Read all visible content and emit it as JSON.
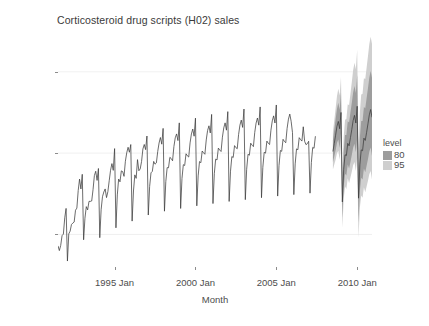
{
  "chart": {
    "title": "Corticosteroid drug scripts (H02) sales",
    "xlabel": "Month",
    "ylabel": "SAU (millions)"
  },
  "legend": {
    "title": "level",
    "items": [
      {
        "label": "80",
        "color": "#9d9d9d"
      },
      {
        "label": "95",
        "color": "#cfcfcf"
      }
    ]
  },
  "axes": {
    "y_ticks": [
      "0.5",
      "1.0",
      "1.5"
    ],
    "x_ticks": [
      "1995 Jan",
      "2000 Jan",
      "2005 Jan",
      "2010 Jan"
    ]
  },
  "chart_data": {
    "type": "line",
    "title": "Corticosteroid drug scripts (H02) sales",
    "xlabel": "Month",
    "ylabel": "SAU (millions)",
    "xlim": [
      "1991 Jul",
      "2010 Dec"
    ],
    "ylim": [
      0.3,
      1.72
    ],
    "y_ticks": [
      0.5,
      1.0,
      1.5
    ],
    "x_ticks": [
      "1995 Jan",
      "2000 Jan",
      "2005 Jan",
      "2010 Jan"
    ],
    "grid": "faint horizontal gridlines at y ticks",
    "legend": {
      "title": "level",
      "position": "right",
      "entries": [
        "80",
        "95"
      ]
    },
    "line_color": "#3b3b3b",
    "interval_colors": {
      "80": "#9d9d9d",
      "95": "#cfcfcf"
    },
    "series": [
      {
        "name": "H02 sales (observed)",
        "type": "line",
        "x_start": "1991 Jul",
        "frequency": "monthly",
        "values": [
          0.429795,
          0.400906,
          0.432159,
          0.492543,
          0.502369,
          0.602652,
          0.660119,
          0.336644,
          0.503512,
          0.52053,
          0.561429,
          0.570043,
          0.576349,
          0.649005,
          0.662149,
          0.770471,
          0.840345,
          0.77962,
          0.869781,
          0.467402,
          0.600015,
          0.671059,
          0.651093,
          0.70377,
          0.703104,
          0.705899,
          0.775434,
          0.86188,
          0.888622,
          0.832225,
          0.905444,
          0.48012,
          0.651685,
          0.73193,
          0.760985,
          0.779884,
          0.726736,
          0.763132,
          0.83,
          0.894543,
          0.9356,
          0.89402,
          1.02783,
          0.540793,
          0.743136,
          0.84052,
          0.823586,
          0.890857,
          0.886397,
          0.85716,
          0.94979,
          1.00188,
          1.03601,
          1.00543,
          1.0528,
          0.582128,
          0.767259,
          0.86628,
          0.844836,
          0.95994,
          0.891638,
          0.903057,
          0.94849,
          1.0254,
          1.05319,
          1.0215,
          1.1051,
          0.619459,
          0.795,
          0.8788,
          0.888,
          0.949,
          0.932,
          0.94,
          1.01,
          1.062,
          1.096,
          1.055,
          1.152,
          0.643,
          0.825,
          0.911,
          0.91,
          0.974,
          0.967,
          0.953,
          1.04,
          1.094,
          1.118,
          1.077,
          1.186,
          0.66,
          0.844,
          0.929,
          0.924,
          0.996,
          0.983,
          0.976,
          1.063,
          1.118,
          1.148,
          1.104,
          1.215,
          0.676,
          0.86,
          0.948,
          0.941,
          1.013,
          1.002,
          0.993,
          1.081,
          1.139,
          1.168,
          1.124,
          1.238,
          0.69,
          0.876,
          0.963,
          0.958,
          1.031,
          1.019,
          1.01,
          1.098,
          1.155,
          1.186,
          1.141,
          1.255,
          0.703,
          0.889,
          0.979,
          0.973,
          1.046,
          1.034,
          1.027,
          1.114,
          1.172,
          1.203,
          1.158,
          1.271,
          0.714,
          0.901,
          0.993,
          0.987,
          1.061,
          1.049,
          1.04,
          1.128,
          1.185,
          1.216,
          1.172,
          1.284,
          0.726,
          0.913,
          1.005,
          1.0,
          1.074,
          1.061,
          1.053,
          1.141,
          1.198,
          1.229,
          1.185,
          1.296,
          0.736,
          0.924,
          1.016,
          1.011,
          1.085,
          1.072,
          1.064,
          1.152,
          1.209,
          1.24,
          1.196,
          1.126,
          0.745,
          0.934,
          1.026,
          1.021,
          1.095,
          1.083,
          1.074,
          1.162,
          1.073,
          1.052,
          1.058,
          1.073,
          0.754,
          0.943,
          1.035,
          1.03,
          1.104
        ]
      },
      {
        "name": "Forecast (point)",
        "type": "line",
        "x_start": "2008 Jul",
        "frequency": "monthly",
        "values": [
          1.01,
          1.06,
          1.11,
          1.165,
          1.195,
          1.15,
          1.25,
          0.7,
          0.9,
          0.99,
          0.985,
          1.06,
          1.045,
          1.095,
          1.145,
          1.2,
          1.232,
          1.185,
          1.288,
          0.723,
          0.928,
          1.02,
          1.015,
          1.092,
          1.078,
          1.128,
          1.18,
          1.235,
          1.268,
          1.22
        ]
      },
      {
        "name": "95% interval",
        "type": "band",
        "x_start": "2008 Jul",
        "frequency": "monthly",
        "lower": [
          0.9,
          0.93,
          0.96,
          1.0,
          1.015,
          0.96,
          1.04,
          0.54,
          0.72,
          0.795,
          0.78,
          0.845,
          0.815,
          0.85,
          0.885,
          0.925,
          0.945,
          0.89,
          0.975,
          0.48,
          0.665,
          0.74,
          0.725,
          0.79,
          0.76,
          0.795,
          0.83,
          0.87,
          0.89,
          0.838
        ],
        "upper": [
          1.13,
          1.2,
          1.275,
          1.35,
          1.395,
          1.355,
          1.47,
          0.88,
          1.1,
          1.205,
          1.21,
          1.3,
          1.295,
          1.365,
          1.435,
          1.51,
          1.555,
          1.515,
          1.635,
          1.03,
          1.25,
          1.36,
          1.365,
          1.46,
          1.455,
          1.525,
          1.595,
          1.67,
          1.715,
          1.672
        ]
      },
      {
        "name": "80% interval",
        "type": "band",
        "x_start": "2008 Jul",
        "frequency": "monthly",
        "lower": [
          0.945,
          0.98,
          1.018,
          1.062,
          1.083,
          1.032,
          1.12,
          0.604,
          0.793,
          0.873,
          0.862,
          0.93,
          0.905,
          0.946,
          0.988,
          1.033,
          1.058,
          1.005,
          1.095,
          0.575,
          0.768,
          0.848,
          0.838,
          0.906,
          0.882,
          0.923,
          0.963,
          1.008,
          1.034,
          0.982
        ],
        "upper": [
          1.08,
          1.142,
          1.208,
          1.272,
          1.31,
          1.266,
          1.375,
          0.8,
          1.013,
          1.112,
          1.112,
          1.196,
          1.188,
          1.25,
          1.308,
          1.373,
          1.412,
          1.37,
          1.48,
          0.888,
          1.095,
          1.198,
          1.198,
          1.284,
          1.276,
          1.338,
          1.399,
          1.464,
          1.505,
          1.463
        ]
      }
    ]
  }
}
